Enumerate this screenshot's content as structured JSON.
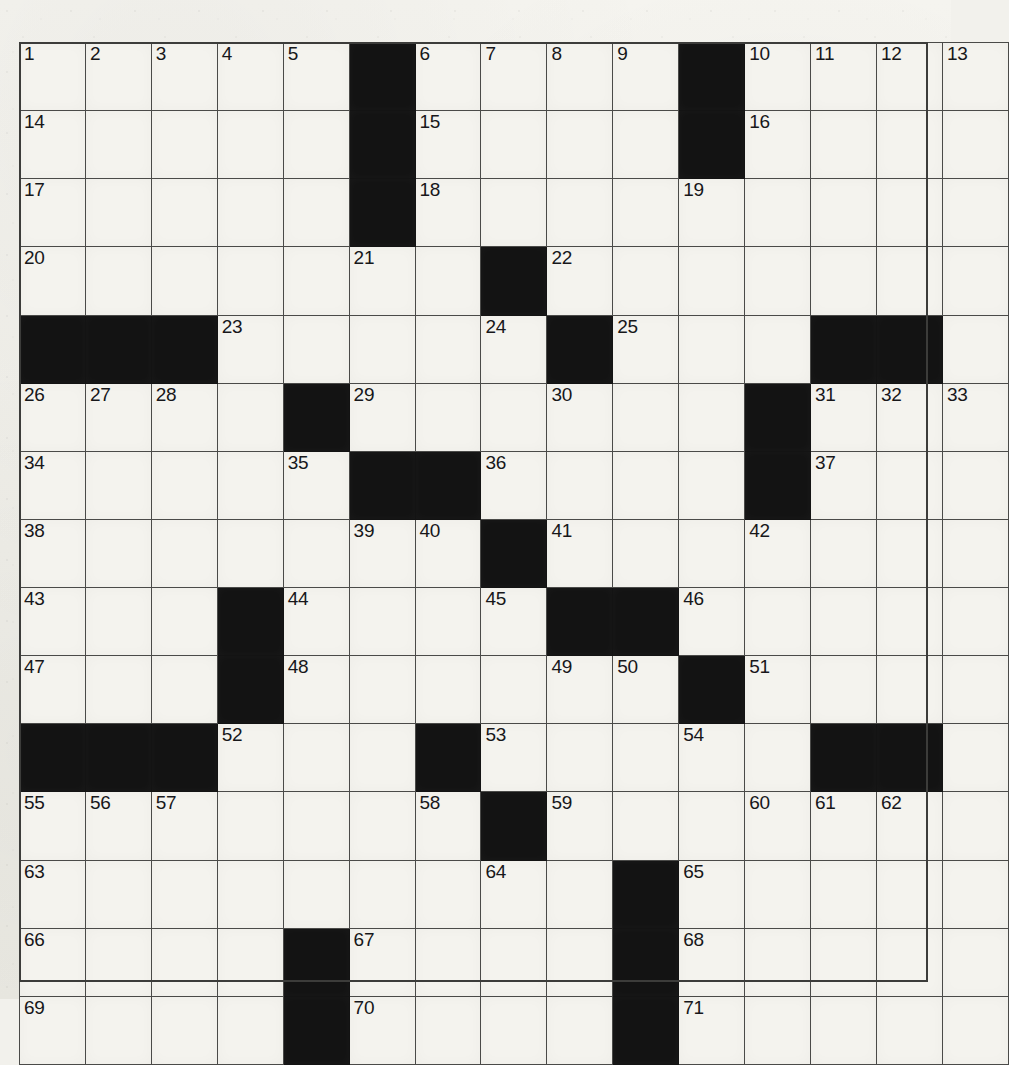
{
  "puzzle": {
    "type": "crossword-grid",
    "rows": 14,
    "columns": 14,
    "cell_count": 196,
    "white_cells": 161,
    "black_cells": 35,
    "highest_clue_number": 71,
    "colors": {
      "paper": "#f2f1ec",
      "cell_fill": "#f4f3ee",
      "block_fill": "#131313",
      "grid_line": "#4a4a48",
      "number_text": "#17171a"
    },
    "grid": [
      [
        {
          "block": false,
          "num": "1"
        },
        {
          "block": false,
          "num": "2"
        },
        {
          "block": false,
          "num": "3"
        },
        {
          "block": false,
          "num": "4"
        },
        {
          "block": false,
          "num": "5"
        },
        {
          "block": true,
          "num": ""
        },
        {
          "block": false,
          "num": "6"
        },
        {
          "block": false,
          "num": "7"
        },
        {
          "block": false,
          "num": "8"
        },
        {
          "block": false,
          "num": "9"
        },
        {
          "block": true,
          "num": ""
        },
        {
          "block": false,
          "num": "10"
        },
        {
          "block": false,
          "num": "11"
        },
        {
          "block": false,
          "num": "12"
        }
      ],
      [
        {
          "block": false,
          "num": "14"
        },
        {
          "block": false,
          "num": ""
        },
        {
          "block": false,
          "num": ""
        },
        {
          "block": false,
          "num": ""
        },
        {
          "block": false,
          "num": ""
        },
        {
          "block": true,
          "num": ""
        },
        {
          "block": false,
          "num": "15"
        },
        {
          "block": false,
          "num": ""
        },
        {
          "block": false,
          "num": ""
        },
        {
          "block": false,
          "num": ""
        },
        {
          "block": true,
          "num": ""
        },
        {
          "block": false,
          "num": "16"
        },
        {
          "block": false,
          "num": ""
        },
        {
          "block": false,
          "num": ""
        }
      ],
      [
        {
          "block": false,
          "num": "17"
        },
        {
          "block": false,
          "num": ""
        },
        {
          "block": false,
          "num": ""
        },
        {
          "block": false,
          "num": ""
        },
        {
          "block": false,
          "num": ""
        },
        {
          "block": true,
          "num": ""
        },
        {
          "block": false,
          "num": "18"
        },
        {
          "block": false,
          "num": ""
        },
        {
          "block": false,
          "num": ""
        },
        {
          "block": false,
          "num": ""
        },
        {
          "block": false,
          "num": "19"
        },
        {
          "block": false,
          "num": ""
        },
        {
          "block": false,
          "num": ""
        },
        {
          "block": false,
          "num": ""
        }
      ],
      [
        {
          "block": false,
          "num": "20"
        },
        {
          "block": false,
          "num": ""
        },
        {
          "block": false,
          "num": ""
        },
        {
          "block": false,
          "num": ""
        },
        {
          "block": false,
          "num": ""
        },
        {
          "block": false,
          "num": "21"
        },
        {
          "block": false,
          "num": ""
        },
        {
          "block": true,
          "num": ""
        },
        {
          "block": false,
          "num": "22"
        },
        {
          "block": false,
          "num": ""
        },
        {
          "block": false,
          "num": ""
        },
        {
          "block": false,
          "num": ""
        },
        {
          "block": false,
          "num": ""
        },
        {
          "block": false,
          "num": ""
        }
      ],
      [
        {
          "block": true,
          "num": ""
        },
        {
          "block": true,
          "num": ""
        },
        {
          "block": true,
          "num": ""
        },
        {
          "block": false,
          "num": "23"
        },
        {
          "block": false,
          "num": ""
        },
        {
          "block": false,
          "num": ""
        },
        {
          "block": false,
          "num": ""
        },
        {
          "block": false,
          "num": "24"
        },
        {
          "block": true,
          "num": ""
        },
        {
          "block": false,
          "num": "25"
        },
        {
          "block": false,
          "num": ""
        },
        {
          "block": false,
          "num": ""
        },
        {
          "block": true,
          "num": ""
        },
        {
          "block": true,
          "num": ""
        }
      ],
      [
        {
          "block": false,
          "num": "26"
        },
        {
          "block": false,
          "num": "27"
        },
        {
          "block": false,
          "num": "28"
        },
        {
          "block": false,
          "num": ""
        },
        {
          "block": true,
          "num": ""
        },
        {
          "block": false,
          "num": "29"
        },
        {
          "block": false,
          "num": ""
        },
        {
          "block": false,
          "num": ""
        },
        {
          "block": false,
          "num": "30"
        },
        {
          "block": false,
          "num": ""
        },
        {
          "block": false,
          "num": ""
        },
        {
          "block": true,
          "num": ""
        },
        {
          "block": false,
          "num": "31"
        },
        {
          "block": false,
          "num": "32"
        }
      ],
      [
        {
          "block": false,
          "num": "34"
        },
        {
          "block": false,
          "num": ""
        },
        {
          "block": false,
          "num": ""
        },
        {
          "block": false,
          "num": ""
        },
        {
          "block": false,
          "num": "35"
        },
        {
          "block": true,
          "num": ""
        },
        {
          "block": true,
          "num": ""
        },
        {
          "block": false,
          "num": "36"
        },
        {
          "block": false,
          "num": ""
        },
        {
          "block": false,
          "num": ""
        },
        {
          "block": false,
          "num": ""
        },
        {
          "block": true,
          "num": ""
        },
        {
          "block": false,
          "num": "37"
        },
        {
          "block": false,
          "num": ""
        }
      ],
      [
        {
          "block": false,
          "num": "38"
        },
        {
          "block": false,
          "num": ""
        },
        {
          "block": false,
          "num": ""
        },
        {
          "block": false,
          "num": ""
        },
        {
          "block": false,
          "num": ""
        },
        {
          "block": false,
          "num": "39"
        },
        {
          "block": false,
          "num": "40"
        },
        {
          "block": true,
          "num": ""
        },
        {
          "block": false,
          "num": "41"
        },
        {
          "block": false,
          "num": ""
        },
        {
          "block": false,
          "num": ""
        },
        {
          "block": false,
          "num": "42"
        },
        {
          "block": false,
          "num": ""
        },
        {
          "block": false,
          "num": ""
        }
      ],
      [
        {
          "block": false,
          "num": "43"
        },
        {
          "block": false,
          "num": ""
        },
        {
          "block": false,
          "num": ""
        },
        {
          "block": true,
          "num": ""
        },
        {
          "block": false,
          "num": "44"
        },
        {
          "block": false,
          "num": ""
        },
        {
          "block": false,
          "num": ""
        },
        {
          "block": false,
          "num": "45"
        },
        {
          "block": true,
          "num": ""
        },
        {
          "block": true,
          "num": ""
        },
        {
          "block": false,
          "num": "46"
        },
        {
          "block": false,
          "num": ""
        },
        {
          "block": false,
          "num": ""
        },
        {
          "block": false,
          "num": ""
        }
      ],
      [
        {
          "block": false,
          "num": "47"
        },
        {
          "block": false,
          "num": ""
        },
        {
          "block": false,
          "num": ""
        },
        {
          "block": true,
          "num": ""
        },
        {
          "block": false,
          "num": "48"
        },
        {
          "block": false,
          "num": ""
        },
        {
          "block": false,
          "num": ""
        },
        {
          "block": false,
          "num": ""
        },
        {
          "block": false,
          "num": "49"
        },
        {
          "block": false,
          "num": "50"
        },
        {
          "block": true,
          "num": ""
        },
        {
          "block": false,
          "num": "51"
        },
        {
          "block": false,
          "num": ""
        },
        {
          "block": false,
          "num": ""
        }
      ],
      [
        {
          "block": true,
          "num": ""
        },
        {
          "block": true,
          "num": ""
        },
        {
          "block": true,
          "num": ""
        },
        {
          "block": false,
          "num": "52"
        },
        {
          "block": false,
          "num": ""
        },
        {
          "block": false,
          "num": ""
        },
        {
          "block": true,
          "num": ""
        },
        {
          "block": false,
          "num": "53"
        },
        {
          "block": false,
          "num": ""
        },
        {
          "block": false,
          "num": ""
        },
        {
          "block": false,
          "num": "54"
        },
        {
          "block": false,
          "num": ""
        },
        {
          "block": true,
          "num": ""
        },
        {
          "block": true,
          "num": ""
        }
      ],
      [
        {
          "block": false,
          "num": "55"
        },
        {
          "block": false,
          "num": "56"
        },
        {
          "block": false,
          "num": "57"
        },
        {
          "block": false,
          "num": ""
        },
        {
          "block": false,
          "num": ""
        },
        {
          "block": false,
          "num": ""
        },
        {
          "block": false,
          "num": "58"
        },
        {
          "block": true,
          "num": ""
        },
        {
          "block": false,
          "num": "59"
        },
        {
          "block": false,
          "num": ""
        },
        {
          "block": false,
          "num": ""
        },
        {
          "block": false,
          "num": "60"
        },
        {
          "block": false,
          "num": "61"
        },
        {
          "block": false,
          "num": "62"
        }
      ],
      [
        {
          "block": false,
          "num": "63"
        },
        {
          "block": false,
          "num": ""
        },
        {
          "block": false,
          "num": ""
        },
        {
          "block": false,
          "num": ""
        },
        {
          "block": false,
          "num": ""
        },
        {
          "block": false,
          "num": ""
        },
        {
          "block": false,
          "num": ""
        },
        {
          "block": false,
          "num": "64"
        },
        {
          "block": false,
          "num": ""
        },
        {
          "block": true,
          "num": ""
        },
        {
          "block": false,
          "num": "65"
        },
        {
          "block": false,
          "num": ""
        },
        {
          "block": false,
          "num": ""
        },
        {
          "block": false,
          "num": ""
        }
      ],
      [
        {
          "block": false,
          "num": "66"
        },
        {
          "block": false,
          "num": ""
        },
        {
          "block": false,
          "num": ""
        },
        {
          "block": false,
          "num": ""
        },
        {
          "block": true,
          "num": ""
        },
        {
          "block": false,
          "num": "67"
        },
        {
          "block": false,
          "num": ""
        },
        {
          "block": false,
          "num": ""
        },
        {
          "block": false,
          "num": ""
        },
        {
          "block": true,
          "num": ""
        },
        {
          "block": false,
          "num": "68"
        },
        {
          "block": false,
          "num": ""
        },
        {
          "block": false,
          "num": ""
        },
        {
          "block": false,
          "num": ""
        }
      ],
      [
        {
          "block": false,
          "num": "69"
        },
        {
          "block": false,
          "num": ""
        },
        {
          "block": false,
          "num": ""
        },
        {
          "block": false,
          "num": ""
        },
        {
          "block": true,
          "num": ""
        },
        {
          "block": false,
          "num": "70"
        },
        {
          "block": false,
          "num": ""
        },
        {
          "block": false,
          "num": ""
        },
        {
          "block": false,
          "num": ""
        },
        {
          "block": true,
          "num": ""
        },
        {
          "block": false,
          "num": "71"
        },
        {
          "block": false,
          "num": ""
        },
        {
          "block": false,
          "num": ""
        },
        {
          "block": false,
          "num": ""
        }
      ]
    ],
    "extra_top_row_cells": {
      "note_row0_col13": "13",
      "note_row5_col13_plus": "33"
    }
  }
}
